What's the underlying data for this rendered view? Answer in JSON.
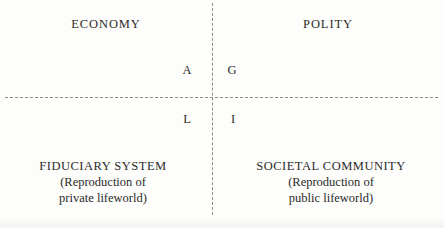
{
  "diagram": {
    "background_color": "#fdfdfb",
    "text_color": "#2b2b29",
    "line_color": "#8d8d8a",
    "line_style": "dashed",
    "quadrants": {
      "top_left": {
        "header": "ECONOMY",
        "letter": "A"
      },
      "top_right": {
        "header": "POLITY",
        "letter": "G"
      },
      "bottom_left": {
        "letter": "L",
        "title": "FIDUCIARY SYSTEM",
        "subtitle_line1": "(Reproduction of",
        "subtitle_line2": "private lifeworld)"
      },
      "bottom_right": {
        "letter": "I",
        "title": "SOCIETAL COMMUNITY",
        "subtitle_line1": "(Reproduction of",
        "subtitle_line2": "public lifeworld)"
      }
    }
  }
}
